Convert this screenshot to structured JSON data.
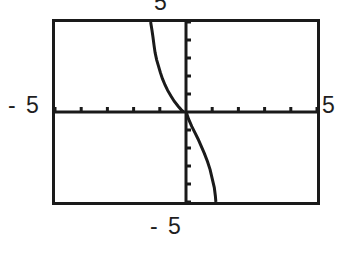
{
  "screen": {
    "title": "graphing-calculator-plot",
    "background_color": "#ffffff",
    "ink_color": "#1a1a1a"
  },
  "labels": {
    "y_max": "5",
    "x_min": "- 5",
    "x_max": "5",
    "y_min": "- 5"
  },
  "chart_data": {
    "type": "line",
    "title": "",
    "xlabel": "",
    "ylabel": "",
    "xlim": [
      -5,
      5
    ],
    "ylim": [
      -5,
      5
    ],
    "grid": false,
    "legend": "none",
    "axis_ticks": {
      "x_tick_interval": 1,
      "x_ticks": [
        -5,
        -4,
        -3,
        -2,
        -1,
        1,
        2,
        3,
        4,
        5
      ],
      "y_tick_interval": 1,
      "y_ticks": [
        -5,
        -4,
        -3,
        -2,
        -1,
        1,
        2,
        3,
        4,
        5
      ]
    },
    "annotations": [
      "decreasing curve with vertical asymptote near x = 0",
      "upper branch in second quadrant descends to x-axis",
      "lower branch in fourth quadrant descends off bottom of window"
    ],
    "series": [
      {
        "name": "upper-branch",
        "x": [
          -1.35,
          -1.3,
          -1.26,
          -1.22,
          -1.18,
          -1.12,
          -1.05,
          -0.98,
          -0.9,
          -0.8,
          -0.7,
          -0.58,
          -0.45,
          -0.3,
          -0.18,
          -0.1
        ],
        "y": [
          5.0,
          4.55,
          4.15,
          3.7,
          3.3,
          2.9,
          2.55,
          2.2,
          1.85,
          1.5,
          1.2,
          0.9,
          0.6,
          0.32,
          0.12,
          0.02
        ]
      },
      {
        "name": "lower-branch",
        "x": [
          0.02,
          0.1,
          0.22,
          0.34,
          0.46,
          0.58,
          0.7,
          0.82,
          0.92,
          1.0,
          1.08,
          1.12,
          1.14
        ],
        "y": [
          -0.05,
          -0.4,
          -0.8,
          -1.15,
          -1.5,
          -1.9,
          -2.3,
          -2.75,
          -3.2,
          -3.7,
          -4.2,
          -4.65,
          -5.0
        ]
      }
    ]
  }
}
